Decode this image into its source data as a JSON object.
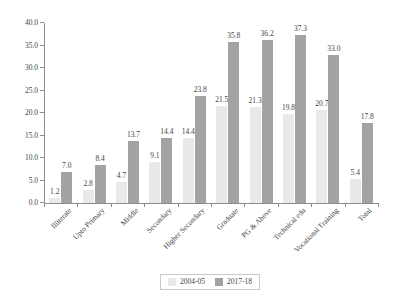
{
  "chart_data": {
    "type": "bar",
    "title": "",
    "subtitle": "",
    "xlabel": "",
    "ylabel": "",
    "ylim": [
      0.0,
      40.0
    ],
    "ytick_labels": [
      "0.0",
      "5.0",
      "10.0",
      "15.0",
      "20.0",
      "25.0",
      "30.0",
      "35.0",
      "40.0"
    ],
    "ytick_values": [
      0.0,
      5.0,
      10.0,
      15.0,
      20.0,
      25.0,
      30.0,
      35.0,
      40.0
    ],
    "grid": false,
    "legend_position": "bottom-center",
    "categories": [
      "Illiterate",
      "Upto Primary",
      "Middle",
      "Secondary",
      "Higher Secondary",
      "Graduate",
      "PG & Above",
      "Technical edu",
      "Vocational Training",
      "Total"
    ],
    "series": [
      {
        "name": "2004-05",
        "color": "#e9e9e9",
        "values": [
          1.2,
          2.8,
          4.7,
          9.1,
          14.4,
          21.5,
          21.3,
          19.8,
          20.7,
          5.4
        ]
      },
      {
        "name": "2017-18",
        "color": "#a3a3a3",
        "values": [
          7.0,
          8.4,
          13.7,
          14.4,
          23.8,
          35.8,
          36.2,
          37.3,
          33.0,
          17.8
        ]
      }
    ],
    "data_labels": [
      [
        "1.2",
        "2.8",
        "4.7",
        "9.1",
        "14.4",
        "21.5",
        "21.3",
        "19.8",
        "20.7",
        "5.4"
      ],
      [
        "7.0",
        "8.4",
        "13.7",
        "14.4",
        "23.8",
        "35.8",
        "36.2",
        "37.3",
        "33.0",
        "17.8"
      ]
    ],
    "legend_entries": [
      "2004-05",
      "2017-18"
    ],
    "axis_color": "#8c8c8c",
    "text_color": "#3f3f3f",
    "background": "#ffffff"
  }
}
